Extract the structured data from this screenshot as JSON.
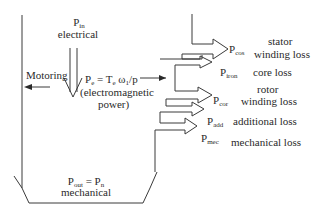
{
  "diagram": {
    "type": "power-flow",
    "input": {
      "symbol": "P",
      "subscript": "in",
      "description": "electrical"
    },
    "mode_label": "Motoring",
    "electromagnetic": {
      "formula_prefix": "P",
      "formula_prefix_sub": "e",
      "formula_eq": " = T",
      "formula_t_sub": "e",
      "formula_rest": " ω",
      "formula_omega_sub": "1",
      "formula_end": "/p",
      "description_line1": "(electromagnetic",
      "description_line2": "power)"
    },
    "losses": [
      {
        "symbol": "P",
        "subscript": "cos",
        "label_line1": "stator",
        "label_line2": "winding loss"
      },
      {
        "symbol": "P",
        "subscript": "iron",
        "label_line1": "core loss",
        "label_line2": ""
      },
      {
        "symbol": "P",
        "subscript": "cor",
        "label_line1": "rotor",
        "label_line2": "winding loss"
      },
      {
        "symbol": "P",
        "subscript": "add",
        "label_line1": "additional loss",
        "label_line2": ""
      },
      {
        "symbol": "P",
        "subscript": "mec",
        "label_line1": "mechanical loss",
        "label_line2": ""
      }
    ],
    "output": {
      "symbol_left": "P",
      "subscript_left": "out",
      "eq": " = P",
      "subscript_right": "n",
      "description": "mechanical"
    }
  }
}
